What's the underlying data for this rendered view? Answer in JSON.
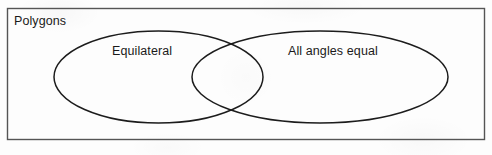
{
  "diagram": {
    "type": "venn",
    "universe": {
      "label": "Polygons",
      "shape": "rectangle"
    },
    "sets": [
      {
        "id": "left",
        "label": "Equilateral",
        "shape": "ellipse"
      },
      {
        "id": "right",
        "label": "All angles equal",
        "shape": "ellipse"
      }
    ],
    "intersection": {
      "label": "",
      "description": "lens-shaped overlap region"
    },
    "colors": {
      "stroke": "#1c1c1c",
      "background": "#fdfdfd",
      "text": "#1a1a1a",
      "border": "#555555"
    }
  }
}
